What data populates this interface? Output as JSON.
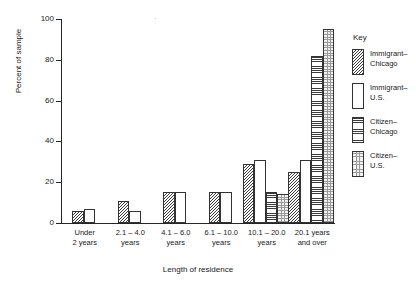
{
  "chart_data": {
    "type": "bar",
    "title": "",
    "xlabel": "Length of residence",
    "ylabel": "Percent of sample",
    "ylim": [
      0,
      100
    ],
    "yticks": [
      0,
      20,
      40,
      60,
      80,
      100
    ],
    "ytick_labels": [
      "0",
      "20",
      "40",
      "60",
      "80",
      "100"
    ],
    "grid": false,
    "legend_position": "right",
    "legend_title": "Key",
    "categories": [
      "Under\n2 years",
      "2.1 – 4.0\nyears",
      "4.1 – 6.0\nyears",
      "6.1 – 10.0\nyears",
      "10.1 – 20.0\nyears",
      "20.1 years\nand over"
    ],
    "series": [
      {
        "name": "Immigrant–\nChicago",
        "pattern": "diagonal-hatch",
        "values": [
          6,
          11,
          15,
          15,
          29,
          25
        ]
      },
      {
        "name": "Immigrant–\nU.S.",
        "pattern": "white-solid",
        "values": [
          7,
          6,
          15,
          15,
          31,
          31
        ]
      },
      {
        "name": "Citizen–\nChicago",
        "pattern": "horizontal-lines",
        "values": [
          null,
          null,
          null,
          null,
          15,
          82
        ]
      },
      {
        "name": "Citizen–\nU.S.",
        "pattern": "stipple-dots",
        "values": [
          null,
          null,
          null,
          null,
          14,
          95
        ]
      }
    ]
  },
  "colors": {
    "axis": "#262626",
    "bar_outline": "#333333",
    "hatch": "#3a3a3a",
    "text": "#1a1a1a",
    "background": "#ffffff"
  }
}
